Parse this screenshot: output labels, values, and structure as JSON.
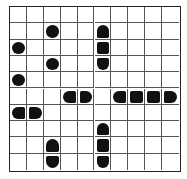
{
  "puzzle": {
    "type": "battleships",
    "rows": 10,
    "cols": 10,
    "colors": {
      "ship": "#111111",
      "grid": "#555555",
      "border": "#222222",
      "background": "#ffffff"
    },
    "ships": [
      {
        "cells": [
          [
            1,
            2
          ]
        ],
        "orientation": "single"
      },
      {
        "cells": [
          [
            2,
            0
          ]
        ],
        "orientation": "single"
      },
      {
        "cells": [
          [
            3,
            2
          ]
        ],
        "orientation": "single"
      },
      {
        "cells": [
          [
            4,
            0
          ]
        ],
        "orientation": "single"
      },
      {
        "cells": [
          [
            1,
            5
          ],
          [
            2,
            5
          ],
          [
            3,
            5
          ]
        ],
        "orientation": "vertical"
      },
      {
        "cells": [
          [
            5,
            3
          ],
          [
            5,
            4
          ]
        ],
        "orientation": "horizontal"
      },
      {
        "cells": [
          [
            5,
            6
          ],
          [
            5,
            7
          ],
          [
            5,
            8
          ],
          [
            5,
            9
          ]
        ],
        "orientation": "horizontal"
      },
      {
        "cells": [
          [
            6,
            0
          ],
          [
            6,
            1
          ]
        ],
        "orientation": "horizontal"
      },
      {
        "cells": [
          [
            8,
            2
          ],
          [
            9,
            2
          ]
        ],
        "orientation": "vertical"
      },
      {
        "cells": [
          [
            7,
            5
          ],
          [
            8,
            5
          ],
          [
            9,
            5
          ]
        ],
        "orientation": "vertical"
      }
    ]
  }
}
